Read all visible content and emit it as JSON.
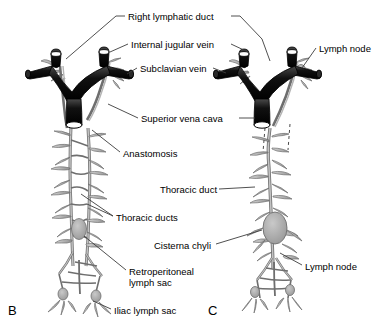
{
  "figure": {
    "panels": [
      {
        "letter": "B",
        "x": 8,
        "y": 303
      },
      {
        "letter": "C",
        "x": 208,
        "y": 303
      }
    ],
    "labels": [
      {
        "name": "right-lymphatic-duct",
        "text": "Right lymphatic duct",
        "x": 128,
        "y": 11,
        "align": "left"
      },
      {
        "name": "internal-jugular-vein",
        "text": "Internal jugular vein",
        "x": 131,
        "y": 39,
        "align": "left"
      },
      {
        "name": "subclavian-vein",
        "text": "Subclavian vein",
        "x": 140,
        "y": 63,
        "align": "left"
      },
      {
        "name": "lymph-node-top-right",
        "text": "Lymph node",
        "x": 319,
        "y": 43,
        "align": "left"
      },
      {
        "name": "superior-vena-cava",
        "text": "Superior vena cava",
        "x": 141,
        "y": 113,
        "align": "left"
      },
      {
        "name": "anastomosis",
        "text": "Anastomosis",
        "x": 123,
        "y": 148,
        "align": "left"
      },
      {
        "name": "thoracic-duct",
        "text": "Thoracic duct",
        "x": 160,
        "y": 184,
        "align": "left"
      },
      {
        "name": "thoracic-ducts",
        "text": "Thoracic ducts",
        "x": 116,
        "y": 212,
        "align": "left"
      },
      {
        "name": "cisterna-chyli",
        "text": "Cisterna chyli",
        "x": 154,
        "y": 240,
        "align": "left"
      },
      {
        "name": "lymph-node-bottom-right",
        "text": "Lymph node",
        "x": 305,
        "y": 261,
        "align": "left"
      },
      {
        "name": "retroperitoneal-lymph-sac",
        "text": "Retroperitoneal",
        "x": 129,
        "y": 266,
        "align": "left"
      },
      {
        "name": "retroperitoneal-lymph-sac-line2",
        "text": "lymph sac",
        "x": 129,
        "y": 277,
        "align": "left"
      },
      {
        "name": "iliac-lymph-sac",
        "text": "Iliac lymph sac",
        "x": 114,
        "y": 305,
        "align": "left"
      }
    ],
    "colors": {
      "vein_dark": "#1a1a1a",
      "vein_outline": "#000000",
      "lymph_fill": "#b8b8b8",
      "lymph_stroke": "#6e6e6e",
      "node_fill": "#a9a9a9",
      "leader_line": "#3c3c3c",
      "background": "#ffffff",
      "text": "#000000"
    }
  }
}
